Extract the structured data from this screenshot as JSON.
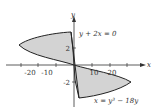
{
  "diagram": {
    "title": "",
    "axes": {
      "x_label": "x",
      "y_label": "y",
      "x_ticks": [
        "-20",
        "-10",
        "10",
        "20"
      ],
      "y_ticks": [
        "2",
        "-2"
      ]
    },
    "curves": [
      {
        "label": "y + 2x = 0"
      },
      {
        "label": "x = y³ − 18y"
      }
    ],
    "colors": {
      "fill": "#d3d3d3",
      "stroke": "#222222",
      "axis": "#333333"
    }
  }
}
